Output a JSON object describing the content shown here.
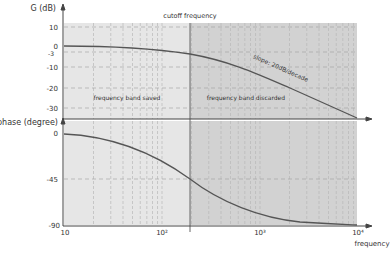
{
  "chart_data": [
    {
      "type": "line",
      "title": "Bode plot – gain",
      "ylabel": "G (dB)",
      "xlabel": "frequency",
      "xscale": "log",
      "xlim": [
        10,
        10000
      ],
      "ylim": [
        -35,
        12
      ],
      "yticks": [
        10,
        0,
        -3,
        -10,
        -20,
        -30
      ],
      "ytick_labels": [
        "10",
        "0",
        "-3",
        "-10",
        "-20",
        "-30"
      ],
      "grid": true,
      "series": [
        {
          "name": "gain",
          "x": [
            10,
            30,
            100,
            195,
            400,
            1000,
            3000,
            10000
          ],
          "y": [
            0,
            -0.2,
            -0.5,
            -3,
            -7,
            -14.5,
            -24,
            -34.5
          ]
        }
      ],
      "annotations": [
        {
          "text": "cutoff frequency",
          "x": 195
        },
        {
          "text": "slope: 20dB/decade"
        },
        {
          "text": "frequency band saved"
        },
        {
          "text": "frequency band discarded"
        }
      ]
    },
    {
      "type": "line",
      "title": "Bode plot – phase",
      "ylabel": "phase (degree)",
      "xlabel": "frequency",
      "xscale": "log",
      "xlim": [
        10,
        10000
      ],
      "ylim": [
        -90,
        0
      ],
      "yticks": [
        0,
        -45,
        -90
      ],
      "ytick_labels": [
        "0",
        "-45",
        "-90"
      ],
      "xticks": [
        10,
        100,
        1000,
        10000
      ],
      "xtick_labels": [
        "10",
        "10²",
        "10³",
        "10⁴"
      ],
      "grid": true,
      "series": [
        {
          "name": "phase",
          "x": [
            10,
            30,
            100,
            195,
            400,
            1000,
            3000,
            10000
          ],
          "y": [
            -3,
            -8.5,
            -27,
            -45,
            -64,
            -79,
            -86,
            -89
          ]
        }
      ]
    }
  ],
  "labels": {
    "gain_axis": "G (dB)",
    "phase_axis": "phase (degree)",
    "x_axis": "frequency",
    "cutoff": "cutoff frequency",
    "slope": "slope: 20dB/decade",
    "band_saved": "frequency band saved",
    "band_discarded": "frequency band discarded",
    "gain_ticks": [
      "10",
      "0",
      "-3",
      "-10",
      "-20",
      "-30"
    ],
    "phase_ticks": [
      "0",
      "-45",
      "-90"
    ],
    "x_ticks": [
      "10",
      "10²",
      "10³",
      "10⁴"
    ]
  },
  "colors": {
    "band_saved_fill": "#e6e6e6",
    "band_discarded_fill": "#d2d2d2",
    "curve": "#555555",
    "grid": "#b8b8b8",
    "axis": "#444444"
  }
}
